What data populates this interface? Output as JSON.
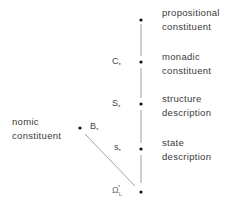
{
  "diagram": {
    "nodes": [
      {
        "id": "propositional",
        "label_line1": "propositional",
        "label_line2": "constituent",
        "symbol": ""
      },
      {
        "id": "monadic",
        "label_line1": "monadic",
        "label_line2": "constituent",
        "symbol": "C",
        "symbol_mark": "*"
      },
      {
        "id": "structure",
        "label_line1": "structure",
        "label_line2": "description",
        "symbol": "S",
        "symbol_mark": "*"
      },
      {
        "id": "state",
        "label_line1": "state",
        "label_line2": "description",
        "symbol": "s",
        "symbol_mark": "*"
      },
      {
        "id": "omega",
        "label_line1": "",
        "label_line2": "",
        "symbol": "Ω",
        "symbol_sub": "L",
        "symbol_sup": "*"
      }
    ],
    "side_node": {
      "id": "nomic",
      "label_line1": "nomic",
      "label_line2": "constituent",
      "symbol": "B",
      "symbol_mark": "*"
    },
    "edges": [
      {
        "from": "propositional",
        "to": "monadic"
      },
      {
        "from": "monadic",
        "to": "structure"
      },
      {
        "from": "structure",
        "to": "state"
      },
      {
        "from": "state",
        "to": "omega"
      },
      {
        "from": "nomic",
        "to": "omega"
      }
    ],
    "colors": {
      "line": "#777777",
      "dot": "#111111",
      "text": "#3a3a3a"
    }
  }
}
